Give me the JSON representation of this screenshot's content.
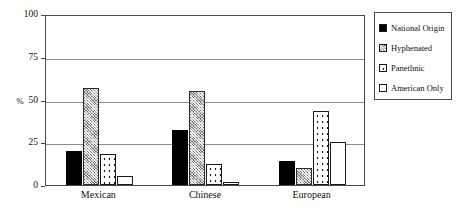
{
  "chart_data": {
    "type": "bar",
    "title": "",
    "xlabel": "",
    "ylabel": "%",
    "ylim": [
      0,
      100
    ],
    "yticks": [
      0,
      25,
      50,
      75,
      100
    ],
    "grid": true,
    "legend_position": "right",
    "categories": [
      "Mexican",
      "Chinese",
      "European"
    ],
    "series": [
      {
        "name": "National Origin",
        "fill": "solid-black",
        "values": [
          20,
          32,
          14
        ]
      },
      {
        "name": "Hyphenated",
        "fill": "gray-hatch",
        "values": [
          57,
          55,
          10
        ]
      },
      {
        "name": "Panethnic",
        "fill": "white-dotted",
        "values": [
          18,
          12,
          43
        ]
      },
      {
        "name": "American Only",
        "fill": "white-empty",
        "values": [
          5,
          2,
          25
        ]
      }
    ]
  },
  "axis": {
    "y_title": "%",
    "y_tick_labels": [
      "100",
      "75",
      "50",
      "25",
      "0"
    ]
  },
  "legend": {
    "items": [
      {
        "label": "National Origin"
      },
      {
        "label": "Hyphenated"
      },
      {
        "label": "Panethnic"
      },
      {
        "label": "American Only"
      }
    ]
  }
}
